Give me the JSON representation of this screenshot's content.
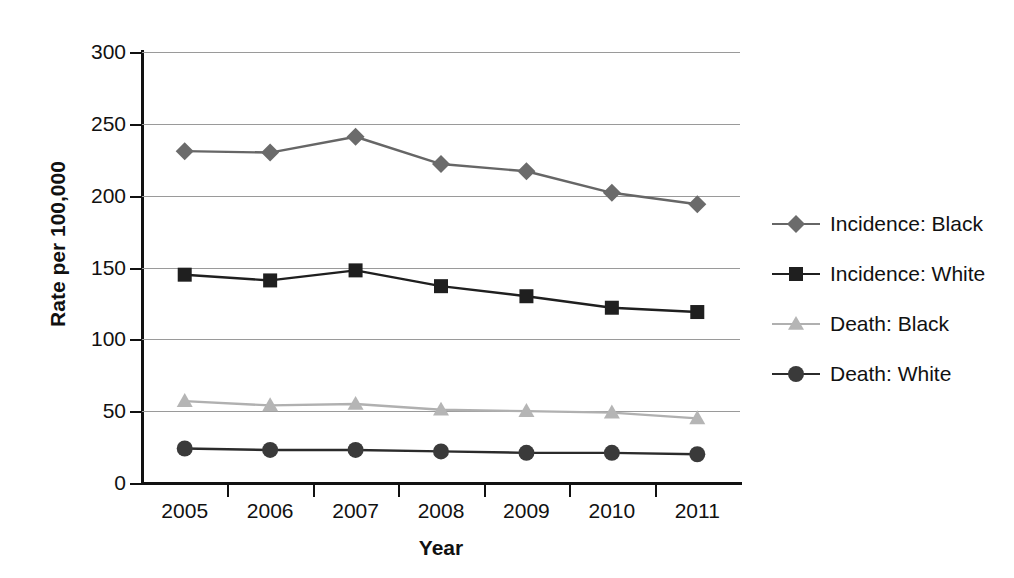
{
  "chart_data": {
    "type": "line",
    "title": "",
    "xlabel": "Year",
    "ylabel": "Rate per 100,000",
    "categories": [
      "2005",
      "2006",
      "2007",
      "2008",
      "2009",
      "2010",
      "2011"
    ],
    "x": [
      2005,
      2006,
      2007,
      2008,
      2009,
      2010,
      2011
    ],
    "ylim": [
      0,
      300
    ],
    "yticks": [
      0,
      50,
      100,
      150,
      200,
      250,
      300
    ],
    "ytick_labels": [
      "0",
      "50",
      "100",
      "150",
      "200",
      "250",
      "300"
    ],
    "grid": true,
    "legend_position": "right",
    "series": [
      {
        "name": "Incidence: Black",
        "marker": "diamond",
        "color": "#6b6b6b",
        "line_color": "#666666",
        "values": [
          231,
          230,
          241,
          222,
          217,
          202,
          194
        ]
      },
      {
        "name": "Incidence: White",
        "marker": "square",
        "color": "#1f1f1f",
        "line_color": "#1f1f1f",
        "values": [
          145,
          141,
          148,
          137,
          130,
          122,
          119
        ]
      },
      {
        "name": "Death: Black",
        "marker": "triangle",
        "color": "#b5b5b5",
        "line_color": "#b0b0b0",
        "values": [
          57,
          54,
          55,
          51,
          50,
          49,
          45
        ]
      },
      {
        "name": "Death: White",
        "marker": "circle",
        "color": "#3a3a3a",
        "line_color": "#2b2b2b",
        "values": [
          24,
          23,
          23,
          22,
          21,
          21,
          20
        ]
      }
    ]
  },
  "colors": {
    "axis": "#111111",
    "grid": "#9a9a9a",
    "background": "#ffffff",
    "incidence_black": "#6b6b6b",
    "incidence_white": "#1f1f1f",
    "death_black": "#b5b5b5",
    "death_white": "#3a3a3a"
  }
}
